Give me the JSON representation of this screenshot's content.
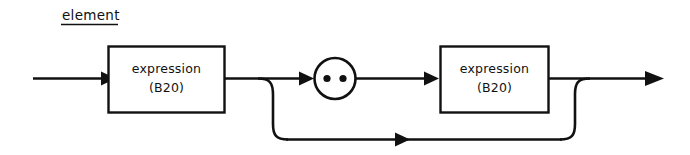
{
  "diagram": {
    "title": "element",
    "title_underlined": true,
    "type": "railroad-syntax-diagram",
    "background_color": "#ffffff",
    "line_color": "#111111",
    "nodes": {
      "first_box": {
        "label_line1": "expression",
        "label_line2": "(B20)",
        "shape": "rectangle"
      },
      "separator": {
        "glyph": "..",
        "glyph_name": "two-dots",
        "shape": "circle",
        "dot_count": 2
      },
      "second_box": {
        "label_line1": "expression",
        "label_line2": "(B20)",
        "shape": "rectangle"
      }
    },
    "paths": {
      "main_label": "main path",
      "bypass_label": "bypass path"
    }
  }
}
